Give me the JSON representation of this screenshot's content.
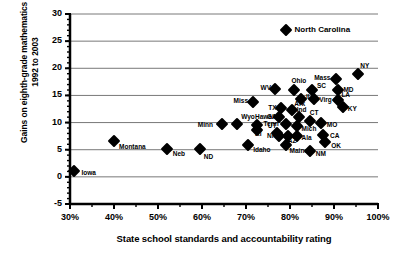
{
  "chart_data": {
    "type": "scatter",
    "title": "",
    "xlabel": "State school standards and accountability rating",
    "ylabel": "Gains on eighth-grade mathematics from 1992 to 2003",
    "xlim": [
      30,
      100
    ],
    "ylim": [
      -5,
      30
    ],
    "xticks": [
      "30%",
      "40%",
      "50%",
      "60%",
      "70%",
      "80%",
      "90%",
      "100%"
    ],
    "xtick_values": [
      30,
      40,
      50,
      60,
      70,
      80,
      90,
      100
    ],
    "yticks": [
      "-5",
      "0",
      "5",
      "10",
      "15",
      "20",
      "25",
      "30"
    ],
    "ytick_values": [
      -5,
      0,
      5,
      10,
      15,
      20,
      25,
      30
    ],
    "grid": "horizontal",
    "minor_tick_interval_x": 5,
    "minor_tick_interval_y": 1,
    "legend": "none",
    "marker_shape": "diamond",
    "marker_color": "#000000",
    "points": [
      {
        "label": "Iowa",
        "x": 31.0,
        "y": 1.0,
        "lx": 7,
        "ly": 2
      },
      {
        "label": "Montana",
        "x": 40.0,
        "y": 6.6,
        "lx": 5,
        "ly": 6
      },
      {
        "label": "Neb",
        "x": 52.0,
        "y": 5.2,
        "lx": 6,
        "ly": 5
      },
      {
        "label": "ND",
        "x": 59.5,
        "y": 5.2,
        "lx": 4,
        "ly": 8
      },
      {
        "label": "Minn",
        "x": 64.5,
        "y": 9.7,
        "lx": -24,
        "ly": 1
      },
      {
        "label": "Wyo",
        "x": 68.0,
        "y": 9.7,
        "lx": 4,
        "ly": -7
      },
      {
        "label": "Hawaii",
        "x": 72.5,
        "y": 9.5,
        "lx": -2,
        "ly": -8
      },
      {
        "label": "RI",
        "x": 72.5,
        "y": 8.6,
        "lx": -2,
        "ly": 4
      },
      {
        "label": "Idaho",
        "x": 70.5,
        "y": 5.8,
        "lx": 5,
        "ly": 5
      },
      {
        "label": "UT",
        "x": 77.0,
        "y": 8.0,
        "lx": -9,
        "ly": -7
      },
      {
        "label": "NH",
        "x": 77.5,
        "y": 7.5,
        "lx": -12,
        "ly": 0
      },
      {
        "label": "AZ",
        "x": 79.5,
        "y": 7.6,
        "lx": 0,
        "ly": 5
      },
      {
        "label": "Maine",
        "x": 79.0,
        "y": 5.8,
        "lx": 4,
        "ly": 6
      },
      {
        "label": "Ala",
        "x": 81.5,
        "y": 7.6,
        "lx": 5,
        "ly": 2
      },
      {
        "label": "Tenn",
        "x": 79.0,
        "y": 9.8,
        "lx": -22,
        "ly": 0
      },
      {
        "label": "Mich",
        "x": 81.5,
        "y": 9.4,
        "lx": 5,
        "ly": 3
      },
      {
        "label": "NM",
        "x": 84.5,
        "y": 4.8,
        "lx": 6,
        "ly": 3
      },
      {
        "label": "OK",
        "x": 88.0,
        "y": 6.4,
        "lx": 6,
        "ly": 4
      },
      {
        "label": "CA",
        "x": 87.5,
        "y": 7.8,
        "lx": 7,
        "ly": 1
      },
      {
        "label": "MO",
        "x": 87.0,
        "y": 10.0,
        "lx": 6,
        "ly": 2
      },
      {
        "label": "CT",
        "x": 84.5,
        "y": 10.2,
        "lx": 0,
        "ly": -8
      },
      {
        "label": "Ind",
        "x": 82.0,
        "y": 11.0,
        "lx": -2,
        "ly": -7
      },
      {
        "label": "GA",
        "x": 77.5,
        "y": 11.0,
        "lx": -12,
        "ly": 0
      },
      {
        "label": "Ark",
        "x": 80.5,
        "y": 12.3,
        "lx": 2,
        "ly": -6
      },
      {
        "label": "TX",
        "x": 78.0,
        "y": 12.6,
        "lx": -13,
        "ly": 0
      },
      {
        "label": "Miss",
        "x": 71.5,
        "y": 13.7,
        "lx": -19,
        "ly": -1
      },
      {
        "label": "WV",
        "x": 76.5,
        "y": 16.2,
        "lx": -14,
        "ly": -1
      },
      {
        "label": "Ohio",
        "x": 81.0,
        "y": 16.0,
        "lx": -3,
        "ly": -9
      },
      {
        "label": "IL",
        "x": 82.5,
        "y": 14.3,
        "lx": 5,
        "ly": -2
      },
      {
        "label": "SC",
        "x": 85.0,
        "y": 16.0,
        "lx": 5,
        "ly": -4
      },
      {
        "label": "Virg",
        "x": 85.5,
        "y": 14.3,
        "lx": 5,
        "ly": 1
      },
      {
        "label": "Mass",
        "x": 90.5,
        "y": 18.0,
        "lx": -22,
        "ly": -1
      },
      {
        "label": "MD",
        "x": 91.0,
        "y": 16.0,
        "lx": 5,
        "ly": 0
      },
      {
        "label": "LA",
        "x": 91.0,
        "y": 14.2,
        "lx": 3,
        "ly": -5
      },
      {
        "label": "KY",
        "x": 92.0,
        "y": 12.8,
        "lx": 5,
        "ly": 2
      },
      {
        "label": "NY",
        "x": 95.5,
        "y": 19.0,
        "lx": 2,
        "ly": -8
      },
      {
        "label": "North Carolina",
        "x": 79.0,
        "y": 27.0,
        "lx": 9,
        "ly": 0
      }
    ]
  }
}
